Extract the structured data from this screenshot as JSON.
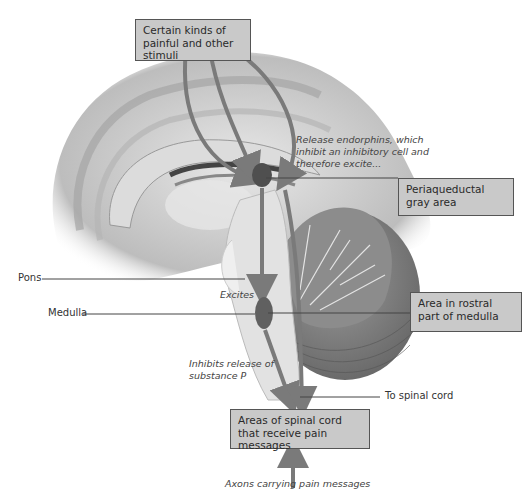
{
  "diagram": {
    "type": "anatomical-pathway",
    "boxes": {
      "stimuli": "Certain kinds of painful and other stimuli",
      "periaqueductal": "Periaqueductal gray area",
      "rostral_medulla": "Area in rostral part of medulla",
      "spinal_areas": "Areas of spinal cord that receive pain messages"
    },
    "labels": {
      "pons": "Pons",
      "medulla": "Medulla",
      "to_spinal_cord": "To spinal cord"
    },
    "annotations": {
      "release_endorphins": "Release endorphins, which inhibit an inhibitory cell and therefore excite...",
      "excites": "Excites",
      "inhibits_release": "Inhibits release of substance P",
      "axons": "Axons carrying pain messages"
    },
    "colors": {
      "box_fill": "#c9c9c9",
      "arrow": "#7a7a7a",
      "nucleus": "#555555",
      "background": "#ffffff"
    }
  }
}
